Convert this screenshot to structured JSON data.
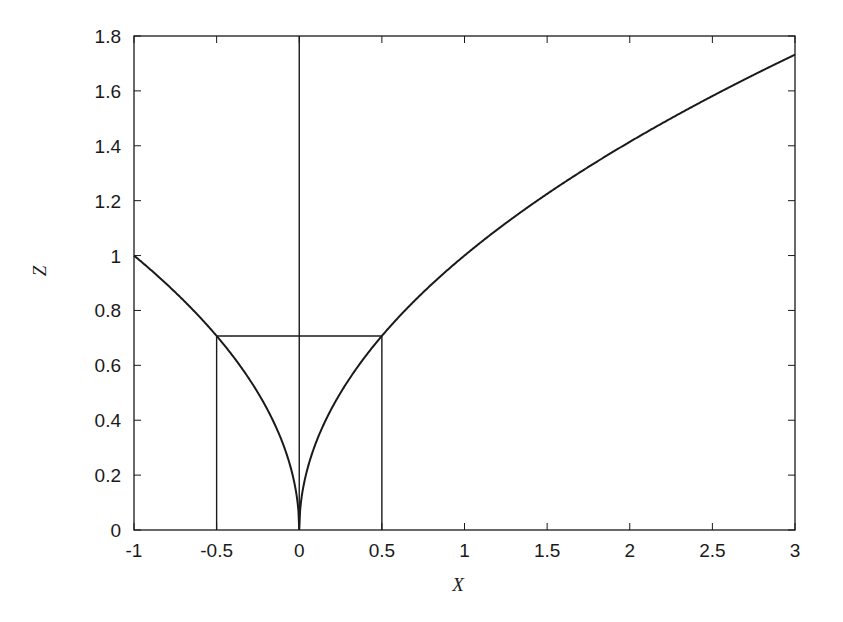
{
  "chart_data": {
    "type": "line",
    "title": "",
    "xlabel": "X",
    "ylabel": "Z",
    "xlim": [
      -1,
      3
    ],
    "ylim": [
      0,
      1.8
    ],
    "grid": false,
    "legend": null,
    "x_ticks": [
      "-1",
      "-0.5",
      "0",
      "0.5",
      "1",
      "1.5",
      "2",
      "2.5",
      "3"
    ],
    "x_tick_values": [
      -1,
      -0.5,
      0,
      0.5,
      1,
      1.5,
      2,
      2.5,
      3
    ],
    "y_ticks": [
      "0",
      "0.2",
      "0.4",
      "0.6",
      "0.8",
      "1",
      "1.2",
      "1.4",
      "1.6",
      "1.8"
    ],
    "y_tick_values": [
      0,
      0.2,
      0.4,
      0.6,
      0.8,
      1,
      1.2,
      1.4,
      1.6,
      1.8
    ],
    "series": [
      {
        "name": "z = sqrt(|x|)",
        "x": [
          -1,
          -0.75,
          -0.5,
          -0.3,
          -0.15,
          -0.05,
          -0.01,
          0,
          0.01,
          0.05,
          0.15,
          0.3,
          0.5,
          0.75,
          1,
          1.5,
          2,
          2.5,
          3
        ],
        "values": [
          1.0,
          0.866,
          0.707,
          0.548,
          0.387,
          0.224,
          0.1,
          0.0,
          0.1,
          0.224,
          0.387,
          0.548,
          0.707,
          0.866,
          1.0,
          1.225,
          1.414,
          1.581,
          1.732
        ]
      }
    ],
    "annotations": [
      {
        "type": "vline",
        "x": -0.5,
        "y_from": 0,
        "y_to": 0.707
      },
      {
        "type": "vline",
        "x": 0,
        "y_from": 0,
        "y_to": 1.8
      },
      {
        "type": "vline",
        "x": 0.5,
        "y_from": 0,
        "y_to": 0.707
      },
      {
        "type": "hline",
        "y": 0.707,
        "x_from": -0.5,
        "x_to": 0.5
      }
    ],
    "line_color": "#1a1a1a"
  }
}
